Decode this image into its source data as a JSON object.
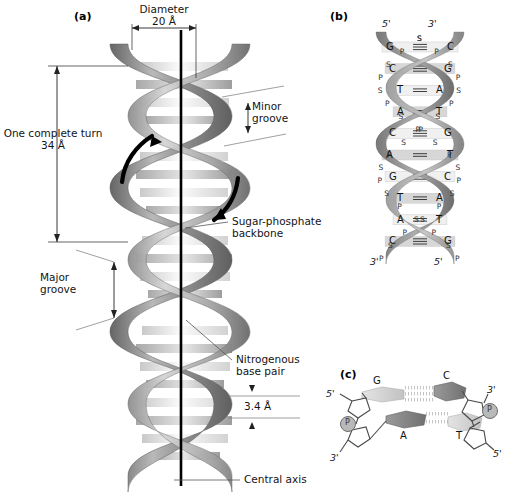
{
  "figure": {
    "background": "#ffffff"
  },
  "panel_a": {
    "tag": "(a)",
    "labels": {
      "diameter": "Diameter\n20 Å",
      "one_turn": "One complete turn\n34 Å",
      "minor_groove": "Minor\ngroove",
      "major_groove": "Major\ngroove",
      "sugar_phosphate": "Sugar-phosphate\nbackbone",
      "nitrogenous": "Nitrogenous\nbase pair",
      "rise": "3.4 Å",
      "central_axis": "Central axis"
    },
    "measurements": {
      "diameter_value": "20 Å",
      "turn_value": "34 Å",
      "rise_value": "3.4 Å"
    },
    "colors": {
      "ribbon_dark": "#6e6e6e",
      "ribbon_mid": "#9a9a9a",
      "ribbon_light": "#cfcfcf",
      "rung_light": "#f2f2f2",
      "rung_mid": "#bdbdbd",
      "axis": "#000000",
      "arrow": "#000000"
    }
  },
  "panel_b": {
    "tag": "(b)",
    "top_left_prime": "5'",
    "top_right_prime": "3'",
    "bottom_left_prime": "3'",
    "bottom_right_prime": "5'",
    "backbone_units": [
      "S",
      "P"
    ],
    "base_pairs": [
      {
        "left": "G",
        "right": "C",
        "bonds": 3
      },
      {
        "left": "C",
        "right": "G",
        "bonds": 3
      },
      {
        "left": "T",
        "right": "A",
        "bonds": 2
      },
      {
        "left": "A",
        "right": "T",
        "bonds": 2
      },
      {
        "left": "C",
        "right": "G",
        "bonds": 3
      },
      {
        "left": "A",
        "right": "T",
        "bonds": 2
      },
      {
        "left": "G",
        "right": "C",
        "bonds": 3
      },
      {
        "left": "T",
        "right": "A",
        "bonds": 2
      },
      {
        "left": "A",
        "right": "T",
        "bonds": 2
      },
      {
        "left": "C",
        "right": "G",
        "bonds": 3
      }
    ]
  },
  "panel_c": {
    "tag": "(c)",
    "left_top_prime": "5'",
    "left_bottom_prime": "3'",
    "right_top_prime": "3'",
    "right_bottom_prime": "5'",
    "phosphate_symbol": "P",
    "pairs": [
      {
        "left_base": "G",
        "right_base": "C",
        "hydrogen_bonds": 3
      },
      {
        "left_base": "A",
        "right_base": "T",
        "hydrogen_bonds": 2
      }
    ]
  }
}
